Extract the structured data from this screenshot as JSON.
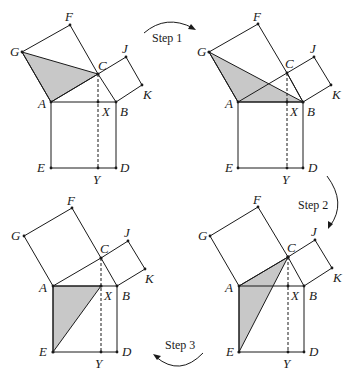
{
  "figure": {
    "colors": {
      "line": "#1a1a1a",
      "shade": "#c8c8c8",
      "background": "#ffffff"
    },
    "point_labels": [
      "A",
      "B",
      "C",
      "D",
      "E",
      "F",
      "G",
      "J",
      "K",
      "X",
      "Y"
    ],
    "steps": [
      {
        "label": "Step 1"
      },
      {
        "label": "Step 2"
      },
      {
        "label": "Step 3"
      }
    ],
    "panels": [
      {
        "name": "panel-1",
        "position": "top-left",
        "shaded_triangle": [
          "G",
          "A",
          "C"
        ],
        "points": {
          "G": [
            22,
            52
          ],
          "F": [
            70,
            25
          ],
          "C": [
            98,
            74
          ],
          "J": [
            126,
            57
          ],
          "K": [
            142,
            85
          ],
          "A": [
            51,
            102
          ],
          "B": [
            116,
            102
          ],
          "X": [
            98,
            102
          ],
          "E": [
            51,
            168
          ],
          "D": [
            116,
            168
          ],
          "Y": [
            98,
            168
          ]
        }
      },
      {
        "name": "panel-2",
        "position": "top-right",
        "shaded_triangle": [
          "G",
          "A",
          "B"
        ],
        "points": {
          "G": [
            209,
            52
          ],
          "F": [
            258,
            24
          ],
          "C": [
            287,
            73
          ],
          "J": [
            314,
            57
          ],
          "K": [
            331,
            85
          ],
          "A": [
            238,
            102
          ],
          "B": [
            303,
            102
          ],
          "X": [
            287,
            102
          ],
          "E": [
            238,
            168
          ],
          "D": [
            303,
            168
          ],
          "Y": [
            287,
            168
          ]
        }
      },
      {
        "name": "panel-3",
        "position": "bottom-left",
        "shaded_triangle": [
          "A",
          "X",
          "E"
        ],
        "points": {
          "G": [
            24,
            236
          ],
          "F": [
            72,
            208
          ],
          "C": [
            101,
            258
          ],
          "J": [
            128,
            241
          ],
          "K": [
            145,
            269
          ],
          "A": [
            53,
            286
          ],
          "B": [
            117,
            286
          ],
          "X": [
            101,
            286
          ],
          "E": [
            53,
            352
          ],
          "D": [
            117,
            352
          ],
          "Y": [
            101,
            352
          ]
        }
      },
      {
        "name": "panel-4",
        "position": "bottom-right",
        "shaded_triangle": [
          "A",
          "C",
          "E"
        ],
        "points": {
          "G": [
            210,
            236
          ],
          "F": [
            258,
            207
          ],
          "C": [
            288,
            257
          ],
          "J": [
            315,
            240
          ],
          "K": [
            332,
            268
          ],
          "A": [
            239,
            286
          ],
          "B": [
            304,
            286
          ],
          "X": [
            288,
            286
          ],
          "E": [
            239,
            352
          ],
          "D": [
            304,
            352
          ],
          "Y": [
            288,
            352
          ]
        }
      }
    ]
  }
}
